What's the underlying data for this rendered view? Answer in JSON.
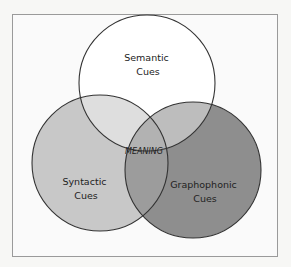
{
  "diagram": {
    "type": "venn",
    "sets": [
      {
        "id": "semantic",
        "label_lines": [
          "Semantic",
          "Cues"
        ],
        "fill": "#ffffff"
      },
      {
        "id": "syntactic",
        "label_lines": [
          "Syntactic",
          "Cues"
        ],
        "fill": "#c9c9c9"
      },
      {
        "id": "graphophonic",
        "label_lines": [
          "Graphophonic",
          "Cues"
        ],
        "fill": "#8f8f8f"
      }
    ],
    "center_label": "MEANING",
    "colors": {
      "outline": "#333333",
      "frame": "#9a9a9a",
      "background": "#fafafa"
    }
  }
}
